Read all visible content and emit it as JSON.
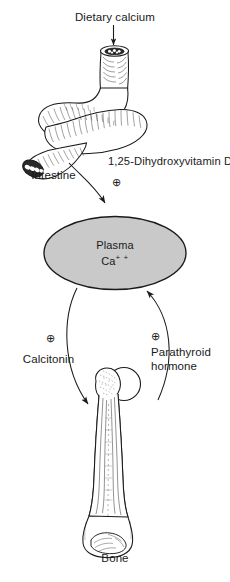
{
  "figure": {
    "title": "Dietary calcium",
    "background_color": "#ffffff",
    "ink_color": "#1a1a1a"
  },
  "labels": {
    "dietary_calcium": "Dietary calcium",
    "intestine": "Intestine",
    "vitamin_d": "1,25-Dihydroxyvitamin D",
    "plasma_line1": "Plasma",
    "plasma_ion_element": "Ca",
    "plasma_ion_charge": "+ +",
    "calcitonin": "Calcitonin",
    "parathyroid_line1": "Parathyroid",
    "parathyroid_line2": "hormone",
    "bone": "Bone"
  },
  "symbols": {
    "plus_in_circle": "⊕",
    "vitamin_d_sign": "⊕",
    "calcitonin_sign": "⊕",
    "parathyroid_sign": "⊕"
  },
  "nodes": [
    {
      "id": "intestine",
      "name": "Intestine",
      "kind": "organ-illustration",
      "shape": "coiled-s-shaped-tube",
      "fill": "#ffffff",
      "stroke": "#1a1a1a"
    },
    {
      "id": "plasma-pool",
      "name": "Plasma Ca++",
      "kind": "compartment",
      "shape": "ellipse",
      "fill": "#c9c9c9",
      "stroke": "#1a1a1a",
      "center_x": 115,
      "center_y": 253,
      "radius_x": 71,
      "radius_y": 36
    },
    {
      "id": "bone",
      "name": "Bone",
      "kind": "organ-illustration",
      "shape": "long-bone-femur",
      "fill": "#ffffff",
      "stroke": "#1a1a1a"
    }
  ],
  "arrows": [
    {
      "id": "dietary-intake",
      "from": "Dietary calcium",
      "to": "Intestine",
      "direction": "down",
      "style": "straight"
    },
    {
      "id": "absorption",
      "from": "Intestine",
      "to": "Plasma Ca++",
      "direction": "down",
      "style": "curved",
      "modulator": "1,25-Dihydroxyvitamin D",
      "sign": "+"
    },
    {
      "id": "deposition",
      "from": "Plasma Ca++",
      "to": "Bone",
      "direction": "down",
      "style": "curved",
      "modulator": "Calcitonin",
      "sign": "+"
    },
    {
      "id": "resorption",
      "from": "Bone",
      "to": "Plasma Ca++",
      "direction": "up",
      "style": "curved",
      "modulator": "Parathyroid hormone",
      "sign": "+"
    }
  ]
}
